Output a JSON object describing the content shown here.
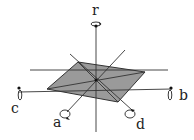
{
  "diagram": {
    "type": "rotation-axes",
    "plane_color": "#9a9a9a",
    "line_color": "#333333",
    "labels": {
      "r": "r",
      "a": "a",
      "b": "b",
      "c": "c",
      "d": "d"
    }
  }
}
